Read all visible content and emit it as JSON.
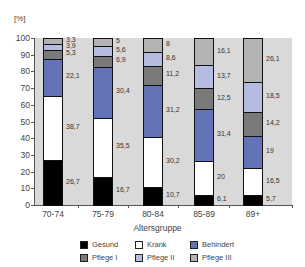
{
  "chart_data": {
    "type": "bar",
    "stacked": true,
    "title": "",
    "ylabel": "[%]",
    "xlabel": "Altersgruppe",
    "ylim": [
      0,
      100
    ],
    "yticks": [
      0,
      10,
      20,
      30,
      40,
      50,
      60,
      70,
      80,
      90,
      100
    ],
    "categories": [
      "70-74",
      "75-79",
      "80-84",
      "85-89",
      "89+"
    ],
    "series": [
      {
        "name": "Gesund",
        "color": "#000000",
        "values": [
          26.7,
          16.7,
          10.7,
          6.1,
          5.7
        ],
        "labels": [
          "26,7",
          "16,7",
          "10,7",
          "6,1",
          "5,7"
        ]
      },
      {
        "name": "Krank",
        "color": "#ffffff",
        "values": [
          38.7,
          35.5,
          30.2,
          20,
          16.5
        ],
        "labels": [
          "38,7",
          "35,5",
          "30,2",
          "20",
          "16,5"
        ]
      },
      {
        "name": "Behindert",
        "color": "#6473b8",
        "values": [
          22.1,
          30.4,
          31.2,
          31.4,
          19
        ],
        "labels": [
          "22,1",
          "30,4",
          "31,2",
          "31,4",
          "19"
        ]
      },
      {
        "name": "Pflege I",
        "color": "#7a7a7a",
        "values": [
          5.3,
          6.9,
          11.2,
          12.5,
          14.2
        ],
        "labels": [
          "5,3",
          "6,9",
          "11,2",
          "12,5",
          "14,2"
        ]
      },
      {
        "name": "Pflege II",
        "color": "#b4bce0",
        "values": [
          3.9,
          5.6,
          8.6,
          13.7,
          18.5
        ],
        "labels": [
          "3,9",
          "5,6",
          "8,6",
          "13,7",
          "18,5"
        ]
      },
      {
        "name": "Pflege III",
        "color": "#b3b3b3",
        "values": [
          3.3,
          5,
          8,
          16.1,
          26.1
        ],
        "labels": [
          "3,3",
          "5",
          "8",
          "16,1",
          "26,1"
        ]
      }
    ],
    "grid": false,
    "legend_position": "bottom",
    "background": "#d9d9d9"
  },
  "legend": {
    "row1": [
      "Gesund",
      "Krank",
      "Behindert"
    ],
    "row2": [
      "Pflege I",
      "Pflege II",
      "Pflege III"
    ]
  }
}
